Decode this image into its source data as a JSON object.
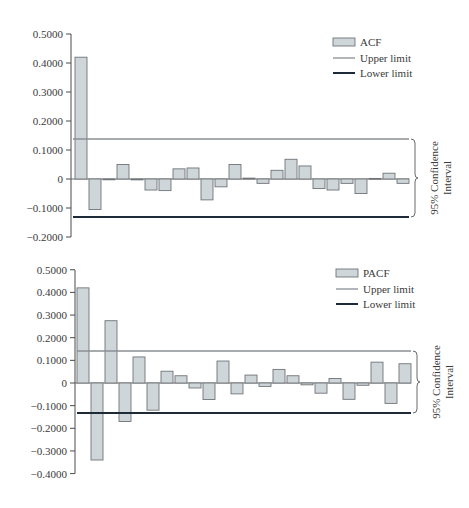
{
  "colors": {
    "bar_fill": "#cfd6da",
    "bar_stroke": "#6f7478",
    "axis": "#4a4a4a",
    "upper_limit": "#8a8f93",
    "lower_limit": "#1f2a38",
    "text": "#3a3a3a"
  },
  "chart_data": [
    {
      "type": "bar",
      "title": "",
      "xlabel": "",
      "ylabel": "",
      "ylim": [
        -0.2,
        0.5
      ],
      "yticks": [
        0.5,
        0.4,
        0.3,
        0.2,
        0.1,
        0,
        -0.1,
        -0.2
      ],
      "ytick_labels": [
        "0.5000",
        "0.4000",
        "0.3000",
        "0.2000",
        "0.1000",
        "0",
        "−0.1000",
        "−0.2000"
      ],
      "grid": false,
      "legend_position": "upper right",
      "legend": [
        "ACF",
        "Upper limit",
        "Lower limit"
      ],
      "categories": [
        1,
        2,
        3,
        4,
        5,
        6,
        7,
        8,
        9,
        10,
        11,
        12,
        13,
        14,
        15,
        16,
        17,
        18,
        19,
        20,
        21,
        22,
        23,
        24
      ],
      "series": [
        {
          "name": "ACF",
          "values": [
            0.42,
            -0.105,
            0.0,
            0.05,
            -0.003,
            -0.038,
            -0.04,
            0.035,
            0.038,
            -0.072,
            -0.027,
            0.05,
            0.003,
            -0.015,
            0.03,
            0.068,
            0.045,
            -0.033,
            -0.038,
            -0.015,
            -0.05,
            0.002,
            0.02,
            -0.015
          ]
        },
        {
          "name": "Upper limit",
          "values": [
            0.138
          ]
        },
        {
          "name": "Lower limit",
          "values": [
            -0.13
          ]
        }
      ],
      "annotation": {
        "line1": "95% Confidence",
        "line2": "Interval"
      }
    },
    {
      "type": "bar",
      "title": "",
      "xlabel": "",
      "ylabel": "",
      "ylim": [
        -0.4,
        0.5
      ],
      "yticks": [
        0.5,
        0.4,
        0.3,
        0.2,
        0.1,
        0,
        -0.1,
        -0.2,
        -0.3,
        -0.4
      ],
      "ytick_labels": [
        "0.5000",
        "0.4000",
        "0.3000",
        "0.2000",
        "0.1000",
        "0",
        "−0.1000",
        "−0.2000",
        "−0.3000",
        "−0.4000"
      ],
      "grid": false,
      "legend_position": "upper right",
      "legend": [
        "PACF",
        "Upper limit",
        "Lower limit"
      ],
      "categories": [
        1,
        2,
        3,
        4,
        5,
        6,
        7,
        8,
        9,
        10,
        11,
        12,
        13,
        14,
        15,
        16,
        17,
        18,
        19,
        20,
        21,
        22,
        23,
        24
      ],
      "series": [
        {
          "name": "PACF",
          "values": [
            0.42,
            -0.34,
            0.275,
            -0.17,
            0.115,
            -0.12,
            0.052,
            0.032,
            -0.022,
            -0.073,
            0.097,
            -0.048,
            0.035,
            -0.015,
            0.06,
            0.032,
            -0.008,
            -0.045,
            0.02,
            -0.072,
            -0.01,
            0.092,
            -0.09,
            0.085
          ]
        },
        {
          "name": "Upper limit",
          "values": [
            0.138
          ]
        },
        {
          "name": "Lower limit",
          "values": [
            -0.13
          ]
        }
      ],
      "annotation": {
        "line1": "95% Confidence",
        "line2": "Interval"
      }
    }
  ],
  "layout": [
    {
      "y_top_px": 34,
      "y_zero_px": 179,
      "px_per_unit": 290,
      "axis_x": 71,
      "first_bar_center": 81,
      "bar_period": 14,
      "bar_width": 12,
      "line_x1": 73,
      "line_x2": 409,
      "upper_y": 139,
      "lower_y": 217,
      "legend_x": 333,
      "legend_y": 43,
      "brace_x": 411,
      "ci_text_x": 440
    },
    {
      "y_top_px": 20,
      "y_zero_px": 133,
      "px_per_unit": 226.5,
      "axis_x": 75,
      "first_bar_center": 83,
      "bar_period": 14,
      "bar_width": 12,
      "line_x1": 77,
      "line_x2": 411,
      "upper_y": 101,
      "lower_y": 163,
      "legend_x": 336,
      "legend_y": 24,
      "brace_x": 413,
      "ci_text_x": 442
    }
  ]
}
